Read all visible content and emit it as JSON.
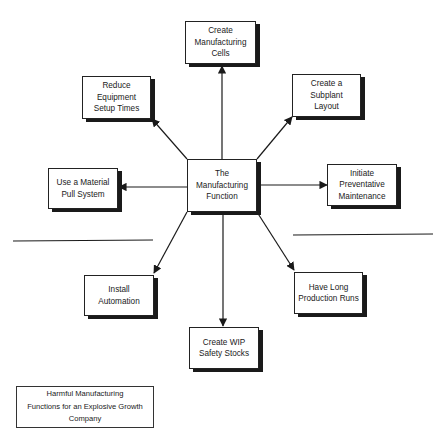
{
  "diagram": {
    "center": {
      "label": "The\nManufacturing\nFunction"
    },
    "nodes": [
      {
        "id": "create-manufacturing-cells",
        "label": "Create\nManufacturing\nCells"
      },
      {
        "id": "reduce-equipment-setup-times",
        "label": "Reduce\nEquipment\nSetup Times"
      },
      {
        "id": "create-subplant-layout",
        "label": "Create a\nSubplant\nLayout"
      },
      {
        "id": "use-material-pull-system",
        "label": "Use a Material\nPull System"
      },
      {
        "id": "initiate-preventative-maintenance",
        "label": "Initiate\nPreventative\nMaintenance"
      },
      {
        "id": "install-automation",
        "label": "Install\nAutomation"
      },
      {
        "id": "have-long-production-runs",
        "label": "Have Long\nProduction Runs"
      },
      {
        "id": "create-wip-safety-stocks",
        "label": "Create WIP\nSafety Stocks"
      }
    ],
    "caption": "Harmful Manufacturing\nFunctions for an Explosive Growth\nCompany",
    "colors": {
      "stroke": "#1a1a1a",
      "background": "#ffffff"
    }
  }
}
